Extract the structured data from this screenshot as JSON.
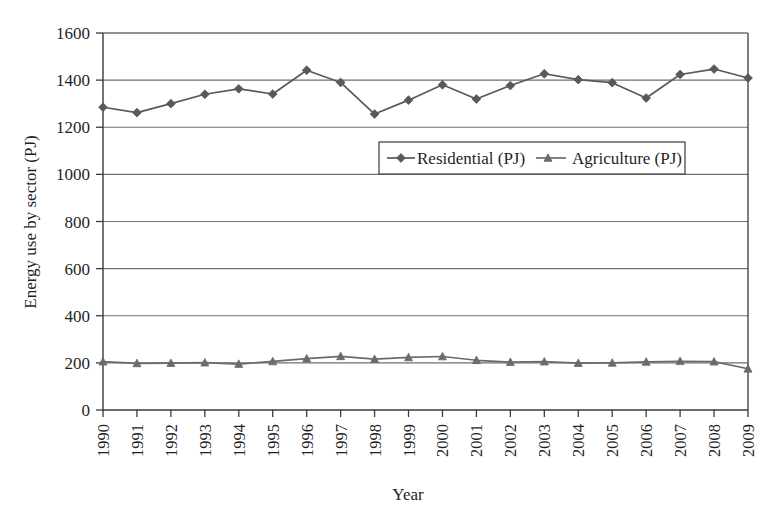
{
  "chart_data": {
    "type": "line",
    "title": "",
    "xlabel": "Year",
    "ylabel": "Energy use by sector (PJ)",
    "xlim": [
      1990,
      2009
    ],
    "ylim": [
      0,
      1600
    ],
    "yticks": [
      0,
      200,
      400,
      600,
      800,
      1000,
      1200,
      1400,
      1600
    ],
    "ytick_labels": [
      "0",
      "200",
      "400",
      "600",
      "800",
      "1000",
      "1200",
      "1400",
      "1600"
    ],
    "grid": "horizontal",
    "legend_position": "inside-upper-center",
    "categories": [
      1990,
      1991,
      1992,
      1993,
      1994,
      1995,
      1996,
      1997,
      1998,
      1999,
      2000,
      2001,
      2002,
      2003,
      2004,
      2005,
      2006,
      2007,
      2008,
      2009
    ],
    "xtick_labels": [
      "1990",
      "1991",
      "1992",
      "1993",
      "1994",
      "1995",
      "1996",
      "1997",
      "1998",
      "1999",
      "2000",
      "2001",
      "2002",
      "2003",
      "2004",
      "2005",
      "2006",
      "2007",
      "2008",
      "2009"
    ],
    "series": [
      {
        "name": "Residential (PJ)",
        "marker": "diamond",
        "color": "#595959",
        "values": [
          1285,
          1262,
          1300,
          1340,
          1363,
          1341,
          1442,
          1390,
          1256,
          1315,
          1380,
          1320,
          1377,
          1427,
          1402,
          1389,
          1324,
          1424,
          1447,
          1409
        ]
      },
      {
        "name": "Agriculture (PJ)",
        "marker": "triangle",
        "color": "#6b6b6b",
        "values": [
          205,
          198,
          199,
          201,
          195,
          206,
          218,
          228,
          216,
          223,
          227,
          211,
          203,
          205,
          199,
          200,
          204,
          207,
          205,
          175
        ]
      }
    ]
  },
  "legend": {
    "entries": [
      {
        "label": "Residential (PJ)"
      },
      {
        "label": "Agriculture (PJ)"
      }
    ]
  },
  "axes": {
    "y_title": "Energy use by sector (PJ)",
    "x_title": "Year"
  },
  "colors": {
    "axis": "#3a3a3a",
    "grid": "#6f6f6f",
    "series_residential": "#595959",
    "series_agriculture": "#6b6b6b",
    "background": "#ffffff"
  }
}
